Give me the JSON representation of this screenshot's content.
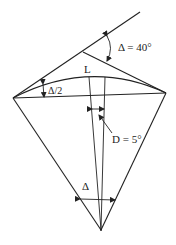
{
  "diagram": {
    "labels": {
      "deflection_angle": "Δ = 40°",
      "half_angle": "Δ/2",
      "length": "L",
      "degree_of_curve": "D = 5°",
      "central_angle": "Δ"
    },
    "colors": {
      "stroke": "#222222",
      "background": "#ffffff"
    },
    "points": {
      "pc": [
        13,
        98
      ],
      "pt": [
        166,
        93
      ],
      "pi": [
        83,
        52
      ],
      "tangent_ext": [
        140,
        12
      ],
      "center": [
        101,
        230
      ]
    }
  }
}
